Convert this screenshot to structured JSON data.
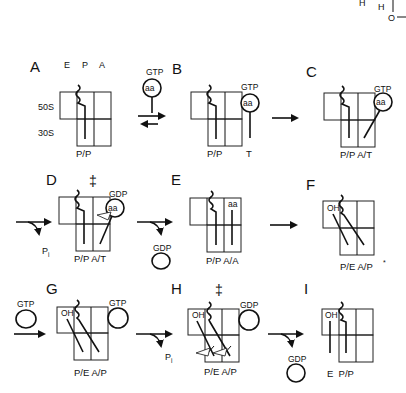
{
  "figure": {
    "corner_fragment": {
      "h1": "H",
      "h2": "H",
      "o": "O"
    },
    "site_labels": {
      "E": "E",
      "P": "P",
      "A": "A"
    },
    "subunit_labels": {
      "large": "50S",
      "small": "30S"
    },
    "double_dagger": "‡",
    "panels": [
      {
        "letter": "A",
        "state": "P/P"
      },
      {
        "letter": "B",
        "state": "P/P",
        "state2": "T",
        "mol_top": "GTP",
        "mol_in": "aa"
      },
      {
        "letter": "C",
        "state": "P/P A/T",
        "mol_top": "GTP",
        "mol_in": "aa"
      },
      {
        "letter": "D",
        "state": "P/P A/T",
        "mol_top": "GDP",
        "mol_in": "aa",
        "released": "P",
        "released_sub": "i"
      },
      {
        "letter": "E",
        "state": "P/P A/A",
        "mol_in": "aa",
        "released": "GDP"
      },
      {
        "letter": "F",
        "state": "P/E A/P",
        "state_mark": "*",
        "oh": "OH"
      },
      {
        "letter": "G",
        "state": "P/E A/P",
        "oh": "OH",
        "incoming": "GTP",
        "bound": "GTP"
      },
      {
        "letter": "H",
        "state": "P/E A/P",
        "oh": "OH",
        "bound": "GDP",
        "released": "P",
        "released_sub": "i"
      },
      {
        "letter": "I",
        "state": "E  P/P",
        "oh": "OH",
        "released": "GDP"
      }
    ],
    "free_ternary": {
      "top": "GTP",
      "inside": "aa"
    }
  }
}
